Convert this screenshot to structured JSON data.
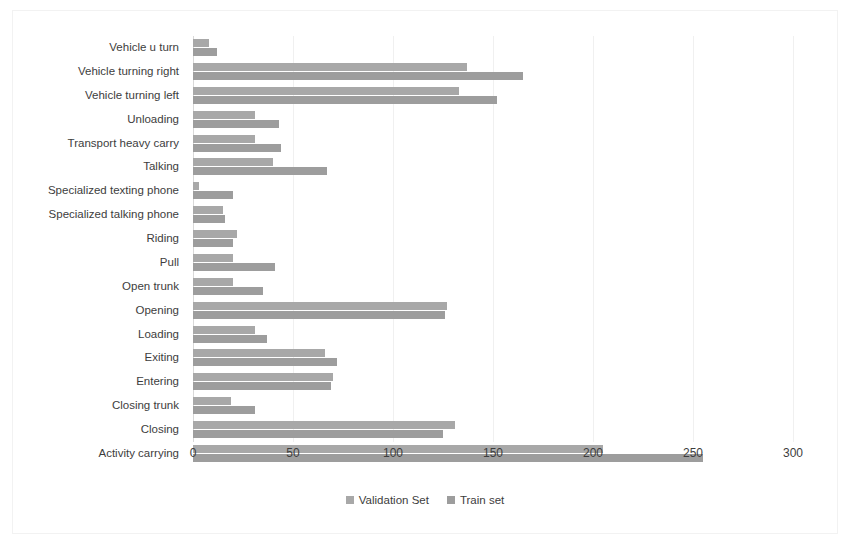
{
  "chart_data": {
    "type": "bar",
    "orientation": "horizontal",
    "title": "",
    "xlabel": "",
    "ylabel": "",
    "xlim": [
      0,
      300
    ],
    "xticks": [
      0,
      50,
      100,
      150,
      200,
      250,
      300
    ],
    "grid": true,
    "legend_position": "bottom-center",
    "categories": [
      "Vehicle u turn",
      "Vehicle turning right",
      "Vehicle turning left",
      "Unloading",
      "Transport heavy carry",
      "Talking",
      "Specialized texting phone",
      "Specialized talking phone",
      "Riding",
      "Pull",
      "Open trunk",
      "Opening",
      "Loading",
      "Exiting",
      "Entering",
      "Closing trunk",
      "Closing",
      "Activity carrying"
    ],
    "series": [
      {
        "name": "Validation Set",
        "color": "#a8a8a8",
        "values": [
          8,
          137,
          133,
          31,
          31,
          40,
          3,
          15,
          22,
          20,
          20,
          127,
          31,
          66,
          70,
          19,
          131,
          205
        ]
      },
      {
        "name": "Train set",
        "color": "#9d9d9d",
        "values": [
          12,
          165,
          152,
          43,
          44,
          67,
          20,
          16,
          20,
          41,
          35,
          126,
          37,
          72,
          69,
          31,
          125,
          255
        ]
      }
    ]
  },
  "legend": {
    "items": [
      {
        "label": "Validation Set",
        "color": "#a8a8a8"
      },
      {
        "label": "Train set",
        "color": "#9d9d9d"
      }
    ]
  }
}
